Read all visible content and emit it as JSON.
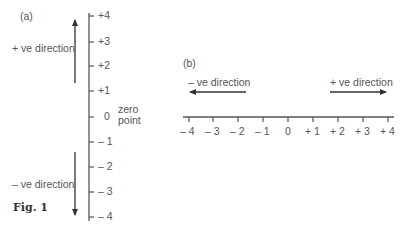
{
  "figure": {
    "caption": "Fig. 1",
    "panel_a": {
      "label": "(a)",
      "positive_direction": "+ ve direction",
      "negative_direction": "– ve direction",
      "zero_label_line1": "zero",
      "zero_label_line2": "point",
      "ticks": [
        "+4",
        "+3",
        "+2",
        "+1",
        "0",
        "– 1",
        "– 2",
        "– 3",
        "– 4"
      ]
    },
    "panel_b": {
      "label": "(b)",
      "negative_direction": "– ve direction",
      "positive_direction": "+ ve direction",
      "ticks": [
        "– 4",
        "– 3",
        "– 2",
        "– 1",
        "0",
        "+ 1",
        "+ 2",
        "+ 3",
        "+ 4"
      ]
    }
  }
}
